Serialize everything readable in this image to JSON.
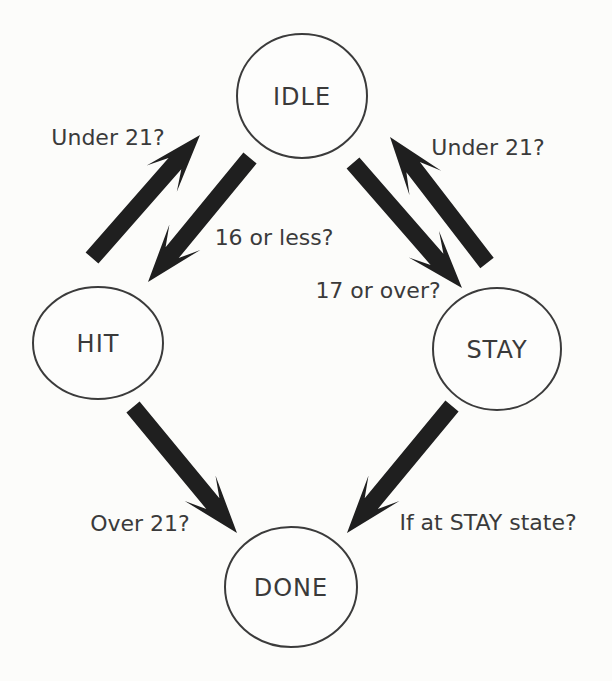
{
  "page": {
    "background": "#fcfcfa"
  },
  "diagram": {
    "type": "state-machine",
    "ink_color": "#1f1f1f",
    "circle_stroke_color": "#3b3b3b",
    "text_color": "#3a3a3a",
    "nodes": [
      {
        "id": "idle",
        "label": "IDLE",
        "cx": 302,
        "cy": 96,
        "rx": 65,
        "ry": 62
      },
      {
        "id": "hit",
        "label": "HIT",
        "cx": 98,
        "cy": 343,
        "rx": 65,
        "ry": 56
      },
      {
        "id": "stay",
        "label": "STAY",
        "cx": 497,
        "cy": 349,
        "rx": 64,
        "ry": 61
      },
      {
        "id": "done",
        "label": "DONE",
        "cx": 291,
        "cy": 587,
        "rx": 66,
        "ry": 60
      }
    ],
    "edges": [
      {
        "id": "hit-to-idle",
        "from": "HIT",
        "to": "IDLE",
        "label": "Under 21?",
        "tail": [
          92,
          258
        ],
        "tip": [
          200,
          135
        ],
        "label_x": 108,
        "label_y": 145
      },
      {
        "id": "idle-to-hit",
        "from": "IDLE",
        "to": "HIT",
        "label": "16 or less?",
        "tail": [
          250,
          158
        ],
        "tip": [
          148,
          282
        ],
        "label_x": 274,
        "label_y": 245
      },
      {
        "id": "idle-to-stay",
        "from": "IDLE",
        "to": "STAY",
        "label": "17 or over?",
        "tail": [
          353,
          163
        ],
        "tip": [
          462,
          288
        ],
        "label_x": 378,
        "label_y": 298
      },
      {
        "id": "stay-to-idle",
        "from": "STAY",
        "to": "IDLE",
        "label": "Under 21?",
        "tail": [
          487,
          263
        ],
        "tip": [
          390,
          137
        ],
        "label_x": 488,
        "label_y": 155
      },
      {
        "id": "hit-to-done",
        "from": "HIT",
        "to": "DONE",
        "label": "Over 21?",
        "tail": [
          133,
          407
        ],
        "tip": [
          237,
          533
        ],
        "label_x": 140,
        "label_y": 531
      },
      {
        "id": "stay-to-done",
        "from": "STAY",
        "to": "DONE",
        "label": "If at STAY state?",
        "tail": [
          452,
          406
        ],
        "tip": [
          347,
          533
        ],
        "label_x": 488,
        "label_y": 530
      }
    ],
    "arrow_style": {
      "shaft_half_width": 8.5,
      "neck": 38,
      "head_length": 58,
      "head_half_width": 20
    }
  }
}
